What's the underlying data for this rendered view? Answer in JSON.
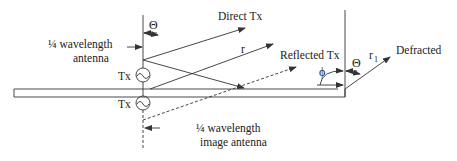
{
  "diagram": {
    "labels": {
      "antenna": [
        "¼ wavelength",
        "antenna"
      ],
      "image_antenna": [
        "¼ wavelength",
        "image antenna"
      ],
      "tx_upper": "Tx",
      "tx_lower": "Tx",
      "direct": "Direct Tx",
      "r": "r",
      "reflected": "Reflected Tx",
      "theta_left": "Θ",
      "phi": "ϕ",
      "theta_right": "Θ",
      "r1": "r",
      "r1_sub": "1",
      "defracted": "Defracted"
    },
    "colors": {
      "line": "#333333",
      "text": "#222222",
      "background": "#ffffff"
    }
  }
}
